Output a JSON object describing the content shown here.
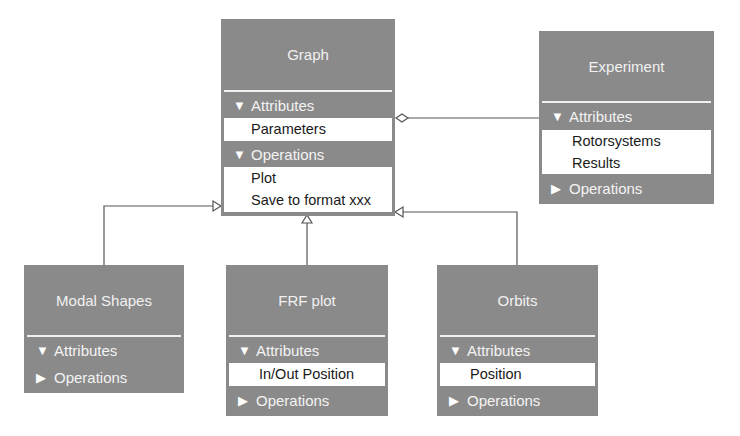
{
  "diagram": {
    "type": "uml-class-diagram",
    "classes": {
      "graph": {
        "name": "Graph",
        "sections": [
          {
            "label": "Attributes",
            "expanded": true,
            "icon": "▼",
            "items": [
              "Parameters"
            ]
          },
          {
            "label": "Operations",
            "expanded": true,
            "icon": "▼",
            "items": [
              "Plot",
              "Save to format xxx"
            ]
          }
        ]
      },
      "experiment": {
        "name": "Experiment",
        "sections": [
          {
            "label": "Attributes",
            "expanded": true,
            "icon": "▼",
            "items": [
              "Rotorsystems",
              "Results"
            ]
          },
          {
            "label": "Operations",
            "expanded": false,
            "icon": "▶",
            "items": []
          }
        ]
      },
      "modal_shapes": {
        "name": "Modal Shapes",
        "sections": [
          {
            "label": "Attributes",
            "expanded": true,
            "icon": "▼",
            "items": []
          },
          {
            "label": "Operations",
            "expanded": false,
            "icon": "▶",
            "items": []
          }
        ]
      },
      "frf_plot": {
        "name": "FRF plot",
        "sections": [
          {
            "label": "Attributes",
            "expanded": true,
            "icon": "▼",
            "items": [
              "In/Out Position"
            ]
          },
          {
            "label": "Operations",
            "expanded": false,
            "icon": "▶",
            "items": []
          }
        ]
      },
      "orbits": {
        "name": "Orbits",
        "sections": [
          {
            "label": "Attributes",
            "expanded": true,
            "icon": "▼",
            "items": [
              "Position"
            ]
          },
          {
            "label": "Operations",
            "expanded": false,
            "icon": "▶",
            "items": []
          }
        ]
      }
    },
    "relations": [
      {
        "from": "Experiment",
        "to": "Graph",
        "type": "aggregation"
      },
      {
        "from": "Modal Shapes",
        "to": "Graph",
        "type": "generalization"
      },
      {
        "from": "FRF plot",
        "to": "Graph",
        "type": "generalization"
      },
      {
        "from": "Orbits",
        "to": "Graph",
        "type": "generalization"
      }
    ],
    "colors": {
      "box": "#8a8a8a",
      "text_on_box": "#f1f1f1",
      "list_bg": "#ffffff",
      "line": "#555555"
    }
  }
}
